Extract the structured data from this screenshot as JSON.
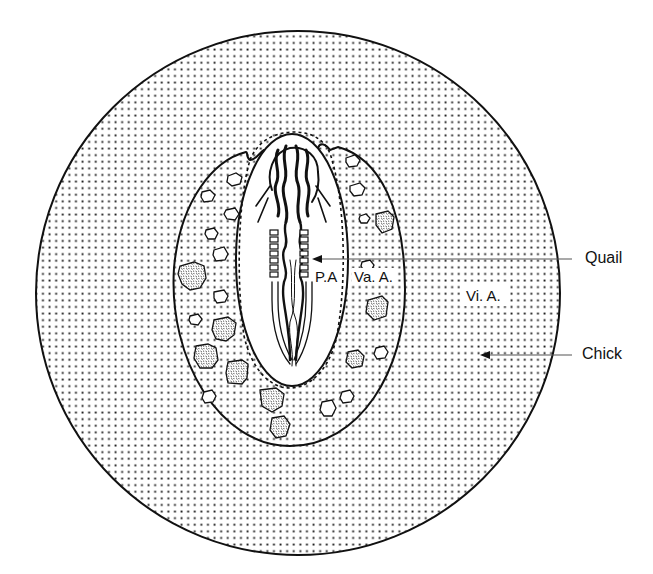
{
  "figure": {
    "type": "quail-chick chimera embryo diagram",
    "labels": {
      "area_pellucida": "P.A",
      "area_vasculosa": "Va. A.",
      "area_vitellina": "Vi. A."
    },
    "callouts": {
      "quail": "Quail",
      "chick": "Chick"
    },
    "colors": {
      "line": "#111111",
      "background": "#ffffff",
      "stipple": "#222222"
    }
  }
}
